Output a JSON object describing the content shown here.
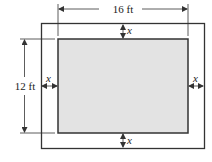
{
  "diagram": {
    "inner_rect": {
      "width_label": "16 ft",
      "height_label": "12 ft",
      "fill": "#e3e3e3"
    },
    "border": {
      "width_label": "x"
    },
    "labels": {
      "top_dimension": "16 ft",
      "left_dimension": "12 ft",
      "top_gap": "x",
      "bottom_gap": "x",
      "left_gap": "x",
      "right_gap": "x"
    },
    "colors": {
      "stroke": "#333333",
      "inner_fill": "#e3e3e3",
      "background": "#ffffff"
    }
  }
}
